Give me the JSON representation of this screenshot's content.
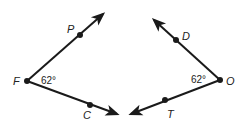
{
  "diagram": {
    "stroke_color": "#1a1a1a",
    "angles": [
      {
        "name": "angle-PFC",
        "vertex": {
          "label": "F",
          "x": 27,
          "y": 81
        },
        "measure": "62°",
        "rays": [
          {
            "point_label": "P",
            "point": {
              "x": 80,
              "y": 35
            },
            "tip": {
              "x": 103,
              "y": 14
            }
          },
          {
            "point_label": "C",
            "point": {
              "x": 90,
              "y": 105
            },
            "tip": {
              "x": 117,
              "y": 114
            }
          }
        ]
      },
      {
        "name": "angle-DOT",
        "vertex": {
          "label": "O",
          "x": 220,
          "y": 80
        },
        "measure": "62°",
        "rays": [
          {
            "point_label": "D",
            "point": {
              "x": 176,
              "y": 40
            },
            "tip": {
              "x": 154,
              "y": 20
            }
          },
          {
            "point_label": "T",
            "point": {
              "x": 165,
              "y": 100
            },
            "tip": {
              "x": 131,
              "y": 114
            }
          }
        ]
      }
    ]
  },
  "labels": {
    "F": "F",
    "P": "P",
    "C": "C",
    "O": "O",
    "D": "D",
    "T": "T",
    "angle_left": "62°",
    "angle_right": "62°"
  }
}
